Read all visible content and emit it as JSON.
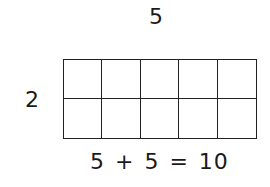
{
  "diagram": {
    "columns_label": "5",
    "rows_label": "2",
    "rows": 2,
    "columns": 5,
    "equation": "5 + 5 = 10"
  }
}
